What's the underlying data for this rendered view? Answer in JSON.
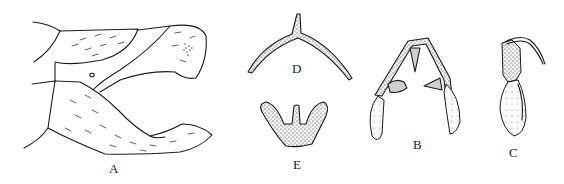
{
  "figure": {
    "panels": [
      {
        "id": "A",
        "label": "A",
        "description": "lateral view of terminal segments"
      },
      {
        "id": "D",
        "label": "D",
        "description": "arched sclerite with median spine"
      },
      {
        "id": "E",
        "label": "E",
        "description": "trilobed sclerite"
      },
      {
        "id": "B",
        "label": "B",
        "description": "paired lobes with inner teeth"
      },
      {
        "id": "C",
        "label": "C",
        "description": "structure with apical hook"
      }
    ]
  }
}
